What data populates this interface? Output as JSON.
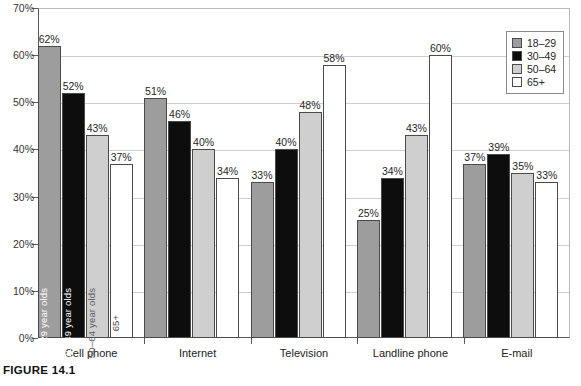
{
  "caption": "FIGURE 14.1",
  "chart_data": {
    "type": "bar",
    "title": "",
    "xlabel": "",
    "ylabel": "",
    "ylim": [
      0,
      70
    ],
    "ytick_labels": [
      "0%",
      "10%",
      "20%",
      "30%",
      "40%",
      "50%",
      "60%",
      "70%"
    ],
    "ytick_values": [
      0,
      10,
      20,
      30,
      40,
      50,
      60,
      70
    ],
    "grid": true,
    "legend_position": "top-right",
    "categories": [
      "Cell phone",
      "Internet",
      "Television",
      "Landline phone",
      "E-mail"
    ],
    "series": [
      {
        "name": "18–29",
        "color": "#9d9d9d",
        "values": [
          62,
          51,
          33,
          25,
          37
        ],
        "value_labels": [
          "62%",
          "51%",
          "33%",
          "25%",
          "37%"
        ]
      },
      {
        "name": "30–49",
        "color": "#0d0d0d",
        "values": [
          52,
          46,
          40,
          34,
          39
        ],
        "value_labels": [
          "52%",
          "46%",
          "40%",
          "34%",
          "39%"
        ]
      },
      {
        "name": "50–64",
        "color": "#cfcfcf",
        "values": [
          43,
          40,
          48,
          43,
          35
        ],
        "value_labels": [
          "43%",
          "40%",
          "48%",
          "43%",
          "35%"
        ]
      },
      {
        "name": "65+",
        "color": "#ffffff",
        "values": [
          37,
          34,
          58,
          60,
          33
        ],
        "value_labels": [
          "37%",
          "34%",
          "58%",
          "60%",
          "33%"
        ]
      }
    ],
    "in_bar_annotations": [
      "18–29 year olds",
      "30–49 year olds",
      "50–64 year olds",
      "65+"
    ],
    "legend_entries": [
      "18–29",
      "30–49",
      "50–64",
      "65+"
    ]
  }
}
